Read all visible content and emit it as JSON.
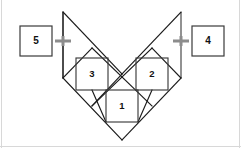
{
  "figure": {
    "background_color": "#ffffff",
    "line_color": "#1a1a1a",
    "square_stroke_color": "#3c3c3c",
    "guide_color": "#6e6e6e",
    "marker_color": "#8c8c8c",
    "box_stroke_color": "#3a3a3a",
    "frame_color": "#d8d8d8"
  },
  "inner_squares": [
    {
      "id": "square-1",
      "label": "1",
      "x": 106,
      "y": 90,
      "size": 32,
      "cx": 122,
      "cy": 106
    },
    {
      "id": "square-2",
      "label": "2",
      "x": 136,
      "y": 58,
      "size": 32,
      "cx": 152,
      "cy": 74
    },
    {
      "id": "square-3",
      "label": "3",
      "x": 76,
      "y": 58,
      "size": 32,
      "cx": 92,
      "cy": 74
    }
  ],
  "callout_boxes": [
    {
      "id": "callout-5",
      "label": "5",
      "x": 20,
      "y": 26,
      "width": 32,
      "height": 30,
      "cx": 36,
      "cy": 41,
      "side": "left"
    },
    {
      "id": "callout-4",
      "label": "4",
      "x": 192,
      "y": 26,
      "width": 32,
      "height": 30,
      "cx": 208,
      "cy": 41,
      "side": "right"
    }
  ],
  "markers": [
    {
      "id": "marker-left",
      "cx": 63,
      "cy": 41,
      "arm": 8,
      "thickness": 3
    },
    {
      "id": "marker-right",
      "cx": 181,
      "cy": 41,
      "arm": 8,
      "thickness": 3
    }
  ],
  "guides": [
    {
      "id": "guide-left",
      "x1": 63,
      "y1": 12,
      "x2": 63,
      "y2": 78
    },
    {
      "id": "guide-right",
      "x1": 181,
      "y1": 12,
      "x2": 181,
      "y2": 78
    }
  ],
  "diagonals": [
    {
      "id": "edge-tl-to-bottom",
      "x1": 63,
      "y1": 12,
      "x2": 122,
      "y2": 74
    },
    {
      "id": "edge-tr-to-center",
      "x1": 181,
      "y1": 12,
      "x2": 122,
      "y2": 74
    },
    {
      "id": "edge-tl-down-left",
      "x1": 63,
      "y1": 12,
      "x2": 63,
      "y2": 78
    },
    {
      "id": "edge-left-v",
      "x1": 63,
      "y1": 78,
      "x2": 122,
      "y2": 140
    },
    {
      "id": "edge-right-v",
      "x1": 181,
      "y1": 78,
      "x2": 122,
      "y2": 140
    },
    {
      "id": "edge-left-upper",
      "x1": 63,
      "y1": 78,
      "x2": 92,
      "y2": 48
    },
    {
      "id": "edge-right-upper",
      "x1": 181,
      "y1": 78,
      "x2": 152,
      "y2": 48
    },
    {
      "id": "cross-left",
      "x1": 92,
      "y1": 48,
      "x2": 152,
      "y2": 106
    },
    {
      "id": "cross-right",
      "x1": 152,
      "y1": 48,
      "x2": 92,
      "y2": 106
    },
    {
      "id": "mid-left-diag",
      "x1": 92,
      "y1": 106,
      "x2": 122,
      "y2": 74
    },
    {
      "id": "bottom-left-diag",
      "x1": 92,
      "y1": 90,
      "x2": 106,
      "y2": 122
    },
    {
      "id": "bottom-right-diag",
      "x1": 152,
      "y1": 90,
      "x2": 138,
      "y2": 122
    }
  ],
  "annotations": {
    "numbers_visible": [
      "1",
      "2",
      "3",
      "4",
      "5"
    ],
    "shape_description": "V / heart outline formed from diagonal lines with three axis-aligned squares inside"
  }
}
